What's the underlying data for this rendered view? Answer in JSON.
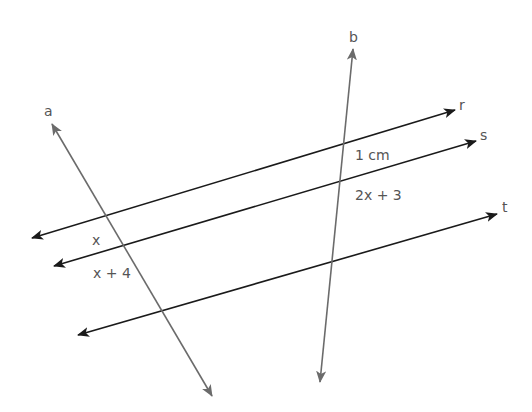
{
  "diagram": {
    "title": "",
    "lines": [
      {
        "id": "a",
        "label": "a",
        "color": "#6b6b6b",
        "x1": 212,
        "y1": 396,
        "x2": 52,
        "y2": 124
      },
      {
        "id": "b",
        "label": "b",
        "color": "#6b6b6b",
        "x1": 320,
        "y1": 382,
        "x2": 353,
        "y2": 49
      },
      {
        "id": "r",
        "label": "r",
        "color": "#1a1a1a",
        "x1": 32,
        "y1": 238,
        "x2": 455,
        "y2": 110
      },
      {
        "id": "s",
        "label": "s",
        "color": "#1a1a1a",
        "x1": 54,
        "y1": 266,
        "x2": 476,
        "y2": 141
      },
      {
        "id": "t",
        "label": "t",
        "color": "#1a1a1a",
        "x1": 78,
        "y1": 335,
        "x2": 497,
        "y2": 214
      }
    ],
    "labels": {
      "a": "a",
      "b": "b",
      "r": "r",
      "s": "s",
      "t": "t",
      "segment_b_rs": "1 cm",
      "segment_b_st": "2x + 3",
      "segment_a_rs": "x",
      "segment_a_st": "x + 4"
    },
    "colors": {
      "transversal": "#6b6b6b",
      "parallel": "#1a1a1a",
      "text": "#555555"
    }
  }
}
